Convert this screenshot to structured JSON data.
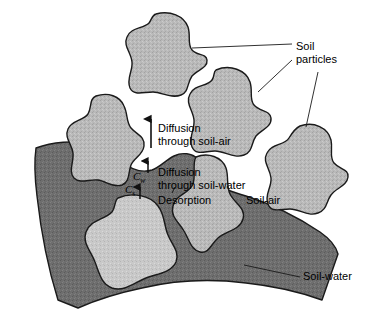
{
  "figure": {
    "background_color": "#ffffff"
  },
  "colors": {
    "soil_particle_fill": "#b9b9b9",
    "soil_particle_fill_light": "#c9c9c9",
    "soil_water_fill": "#6e6e6e",
    "soil_air_fill": "#ffffff",
    "outline": "#1a1a1a",
    "leader_line": "#1a1a1a",
    "text": "#000000"
  },
  "labels": {
    "soil_particles": "Soil\nparticles",
    "soil_air": "Soil-air",
    "soil_water": "Soil-water",
    "diffusion_through_soil_air": "Diffusion\nthrough soil-air",
    "diffusion_through_soil_water": "Diffusion\nthrough soil-water",
    "desorption": "Desorption"
  },
  "variables": {
    "concentration_water": {
      "symbol": "C",
      "subscript": "w",
      "meaning": "concentration in soil-water"
    },
    "concentration_sorbed": {
      "symbol": "C",
      "subscript": "s",
      "meaning": "concentration sorbed on soil particle"
    }
  },
  "arrows": [
    {
      "name": "diffusion-soil-air-arrow",
      "direction": "up",
      "length": "long"
    },
    {
      "name": "diffusion-soil-water-arrow",
      "direction": "up",
      "length": "short"
    },
    {
      "name": "desorption-arrow",
      "direction": "up",
      "length": "short"
    }
  ],
  "regions": [
    {
      "name": "soil-particle-top",
      "kind": "soil particle"
    },
    {
      "name": "soil-particle-middle",
      "kind": "soil particle"
    },
    {
      "name": "soil-particle-right",
      "kind": "soil particle"
    },
    {
      "name": "soil-particle-upper-left",
      "kind": "soil particle"
    },
    {
      "name": "soil-particle-center",
      "kind": "soil particle"
    },
    {
      "name": "soil-particle-submerged",
      "kind": "soil particle"
    },
    {
      "name": "soil-water-body",
      "kind": "soil-water"
    },
    {
      "name": "soil-air-void",
      "kind": "soil-air"
    }
  ],
  "caption_sliver": ""
}
